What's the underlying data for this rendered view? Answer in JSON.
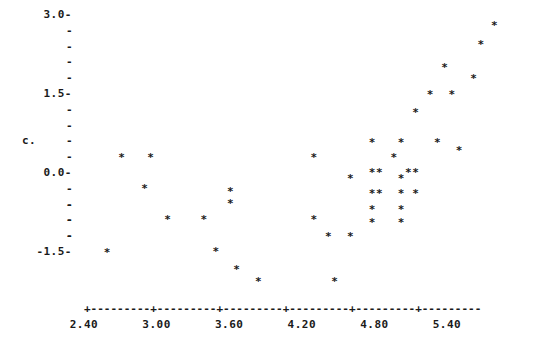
{
  "chart_data": {
    "type": "scatter",
    "title": "",
    "xlabel": "",
    "ylabel": "c.",
    "marker": "*",
    "grid": false,
    "legend": null,
    "xlim": [
      2.4,
      5.97
    ],
    "ylim": [
      -2.1,
      3.08
    ],
    "xticks": [
      2.4,
      3.0,
      3.6,
      4.2,
      4.8,
      5.4
    ],
    "xtick_labels": [
      "2.40",
      "3.00",
      "3.60",
      "4.20",
      "4.80",
      "5.40"
    ],
    "yticks": [
      3.0,
      1.5,
      0.0,
      -1.5
    ],
    "ytick_labels": [
      "3.0",
      "1.5",
      "0.0",
      "-1.5"
    ],
    "y_minor_ticks_between": 4,
    "axis_style": "dashed-with-plus-ticks",
    "points": [
      {
        "x": 2.59,
        "y": -1.47
      },
      {
        "x": 2.71,
        "y": 0.35
      },
      {
        "x": 2.95,
        "y": 0.35
      },
      {
        "x": 2.9,
        "y": -0.24
      },
      {
        "x": 3.09,
        "y": -0.83
      },
      {
        "x": 3.39,
        "y": -0.83
      },
      {
        "x": 3.49,
        "y": -1.44
      },
      {
        "x": 3.61,
        "y": -0.3
      },
      {
        "x": 3.61,
        "y": -0.53
      },
      {
        "x": 3.66,
        "y": -1.79
      },
      {
        "x": 3.84,
        "y": -2.02
      },
      {
        "x": 4.3,
        "y": 0.35
      },
      {
        "x": 4.3,
        "y": -0.83
      },
      {
        "x": 4.42,
        "y": -1.16
      },
      {
        "x": 4.47,
        "y": -2.02
      },
      {
        "x": 4.6,
        "y": -0.06
      },
      {
        "x": 4.6,
        "y": -1.16
      },
      {
        "x": 4.78,
        "y": 0.06
      },
      {
        "x": 4.84,
        "y": 0.06
      },
      {
        "x": 4.78,
        "y": -0.35
      },
      {
        "x": 4.84,
        "y": -0.35
      },
      {
        "x": 4.78,
        "y": -0.65
      },
      {
        "x": 4.78,
        "y": -0.89
      },
      {
        "x": 4.78,
        "y": 0.62
      },
      {
        "x": 4.96,
        "y": 0.35
      },
      {
        "x": 5.02,
        "y": 0.62
      },
      {
        "x": 5.02,
        "y": -0.06
      },
      {
        "x": 5.02,
        "y": -0.35
      },
      {
        "x": 5.02,
        "y": -0.65
      },
      {
        "x": 5.02,
        "y": -0.89
      },
      {
        "x": 5.08,
        "y": 0.06
      },
      {
        "x": 5.14,
        "y": 1.19
      },
      {
        "x": 5.14,
        "y": 0.06
      },
      {
        "x": 5.14,
        "y": -0.35
      },
      {
        "x": 5.26,
        "y": 1.53
      },
      {
        "x": 5.32,
        "y": 0.62
      },
      {
        "x": 5.38,
        "y": 2.06
      },
      {
        "x": 5.44,
        "y": 1.53
      },
      {
        "x": 5.5,
        "y": 0.47
      },
      {
        "x": 5.62,
        "y": 1.84
      },
      {
        "x": 5.68,
        "y": 2.48
      },
      {
        "x": 5.79,
        "y": 2.84
      }
    ]
  },
  "axis": {
    "x_axis_line": "+---------+---------+---------+---------+---------+---------",
    "y_minor_dash": "-",
    "y_major_dash": "-"
  }
}
